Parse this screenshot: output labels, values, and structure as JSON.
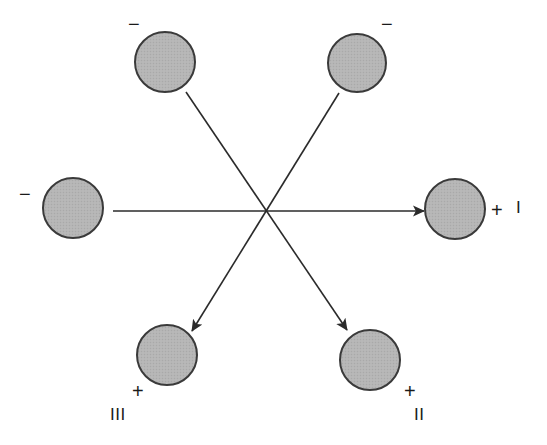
{
  "figure": {
    "canvas": {
      "width": 547,
      "height": 445,
      "background": "#ffffff"
    },
    "style": {
      "circle_fill": "#b5b5b5",
      "circle_stroke": "#3a3a3a",
      "circle_stroke_width": 2,
      "circle_radius": 30,
      "line_color": "#2b2b2b",
      "line_width": 1.6,
      "text_color": "#1a1a1a"
    },
    "crossing_point": {
      "x": 265,
      "y": 211
    },
    "nodes": [
      {
        "id": "top-left",
        "cx": 165,
        "cy": 62,
        "r": 30,
        "polarity": "−",
        "polarity_x": 128,
        "polarity_y": 14,
        "axis": null,
        "axis_x": null,
        "axis_y": null
      },
      {
        "id": "top-right",
        "cx": 357,
        "cy": 63,
        "r": 29,
        "polarity": "−",
        "polarity_x": 381,
        "polarity_y": 14,
        "axis": null,
        "axis_x": null,
        "axis_y": null
      },
      {
        "id": "left",
        "cx": 73,
        "cy": 208,
        "r": 30,
        "polarity": "−",
        "polarity_x": 19,
        "polarity_y": 184,
        "axis": null,
        "axis_x": null,
        "axis_y": null
      },
      {
        "id": "right",
        "cx": 455,
        "cy": 209,
        "r": 30,
        "polarity": "+",
        "polarity_x": 491,
        "polarity_y": 200,
        "axis": "I",
        "axis_x": 516,
        "axis_y": 199
      },
      {
        "id": "bottom-left",
        "cx": 167,
        "cy": 355,
        "r": 30,
        "polarity": "+",
        "polarity_x": 132,
        "polarity_y": 381,
        "axis": "III",
        "axis_x": 110,
        "axis_y": 406
      },
      {
        "id": "bottom-right",
        "cx": 370,
        "cy": 360,
        "r": 30,
        "polarity": "+",
        "polarity_x": 404,
        "polarity_y": 381,
        "axis": "II",
        "axis_x": 414,
        "axis_y": 406
      }
    ],
    "arrows": [
      {
        "id": "axis-I",
        "from_node": "left",
        "to_node": "right",
        "x1": 113,
        "y1": 211,
        "x2": 424,
        "y2": 211
      },
      {
        "id": "axis-III",
        "from_node": "top-right",
        "to_node": "bottom-left",
        "x1": 339,
        "y1": 93,
        "x2": 192,
        "y2": 331
      },
      {
        "id": "axis-II",
        "from_node": "top-left",
        "to_node": "bottom-right",
        "x1": 186,
        "y1": 92,
        "x2": 347,
        "y2": 330
      }
    ]
  }
}
